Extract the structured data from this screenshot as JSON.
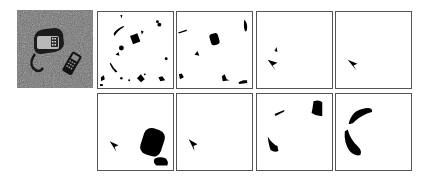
{
  "figure": {
    "colors": {
      "mask_foreground": "#000000",
      "mask_background": "#ffffff",
      "border": "#555555"
    },
    "source_panel": {
      "label": "input-photo"
    },
    "rows": [
      {
        "masks": [
          {
            "label": "mask-1-1"
          },
          {
            "label": "mask-1-2"
          },
          {
            "label": "mask-1-3"
          },
          {
            "label": "mask-1-4"
          }
        ]
      },
      {
        "masks": [
          {
            "label": "mask-2-1"
          },
          {
            "label": "mask-2-2"
          },
          {
            "label": "mask-2-3"
          },
          {
            "label": "mask-2-4"
          }
        ]
      }
    ]
  }
}
